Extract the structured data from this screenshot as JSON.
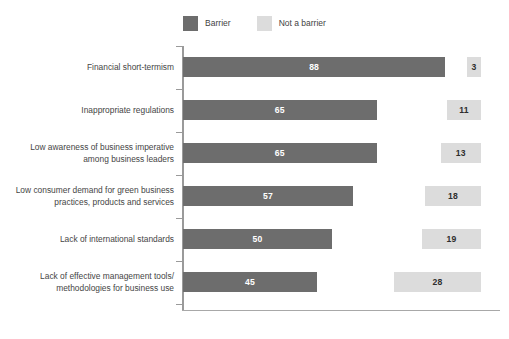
{
  "legend": {
    "position": "top-center",
    "entries": [
      {
        "label": "Barrier",
        "color": "#6d6d6d",
        "swatch_name": "legend-swatch-barrier"
      },
      {
        "label": "Not a barrier",
        "color": "#dcdcdc",
        "swatch_name": "legend-swatch-not-a-barrier"
      }
    ]
  },
  "chart_data": {
    "type": "bar",
    "orientation": "horizontal",
    "title": "",
    "subtitle": "",
    "xlabel": "",
    "ylabel": "",
    "grid": false,
    "legend_position": "top-center",
    "axis_range": [
      0,
      100
    ],
    "categories": [
      "Financial short-termism",
      "Inappropriate regulations",
      "Low awareness of business imperative among business leaders",
      "Low consumer demand for green business practices, products and services",
      "Lack of international standards",
      "Lack of effective management tools/ methodologies for business use"
    ],
    "category_lines": [
      [
        "Financial short-termism"
      ],
      [
        "Inappropriate regulations"
      ],
      [
        "Low awareness of business imperative",
        "among business leaders"
      ],
      [
        "Low consumer demand for green business",
        "practices, products and services"
      ],
      [
        "Lack of international standards"
      ],
      [
        "Lack of effective management tools/",
        "methodologies for business use"
      ]
    ],
    "series": [
      {
        "name": "Barrier",
        "color": "#6d6d6d",
        "values": [
          88,
          65,
          65,
          57,
          50,
          45
        ]
      },
      {
        "name": "Not a barrier",
        "color": "#dcdcdc",
        "values": [
          3,
          11,
          13,
          18,
          19,
          28
        ]
      }
    ]
  },
  "colors": {
    "barrier": "#6d6d6d",
    "not_barrier": "#dcdcdc",
    "axis": "#9a9a9a",
    "label_text": "#454545",
    "background": "#ffffff"
  }
}
